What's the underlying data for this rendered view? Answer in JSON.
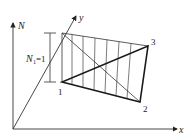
{
  "diagram": {
    "axes": {
      "n_label": "N",
      "x_label": "x",
      "y_label": "y"
    },
    "nodes": [
      {
        "id": "1",
        "label": "1"
      },
      {
        "id": "2",
        "label": "2"
      },
      {
        "id": "3",
        "label": "3"
      }
    ],
    "dimension": {
      "label_main": "N",
      "label_sub": "1",
      "label_eq": "=1"
    },
    "colors": {
      "line": "#333333",
      "thick": "#1a1a1a",
      "background": "#ffffff"
    }
  }
}
